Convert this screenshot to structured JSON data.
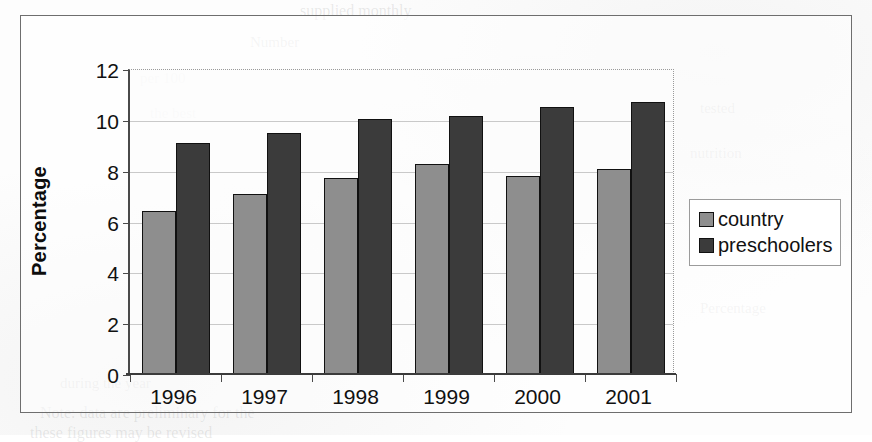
{
  "chart_data": {
    "type": "bar",
    "title": "",
    "xlabel": "",
    "ylabel": "Percentage",
    "categories": [
      "1996",
      "1997",
      "1998",
      "1999",
      "2000",
      "2001"
    ],
    "series": [
      {
        "name": "country",
        "color": "#8e8e8e",
        "values": [
          6.4,
          7.1,
          7.7,
          8.25,
          7.8,
          8.05
        ]
      },
      {
        "name": "preschoolers",
        "color": "#3b3b3b",
        "values": [
          9.1,
          9.5,
          10.05,
          10.15,
          10.5,
          10.7
        ]
      }
    ],
    "ylim": [
      0,
      12
    ],
    "yticks": [
      0,
      2,
      4,
      6,
      8,
      10,
      12
    ],
    "ytick_labels": [
      "0",
      "2",
      "4",
      "6",
      "8",
      "10",
      "12"
    ],
    "grid": true,
    "legend_position": "right"
  },
  "legend": {
    "entries": [
      {
        "label": "country"
      },
      {
        "label": "preschoolers"
      }
    ]
  },
  "page_bleed": {
    "lines": [
      "supplied monthly",
      "Number",
      "per 100",
      "the best",
      "tested",
      "nutrition",
      "Percentage",
      "during the year",
      "Note: data are preliminary for the",
      "these figures may be revised"
    ]
  }
}
